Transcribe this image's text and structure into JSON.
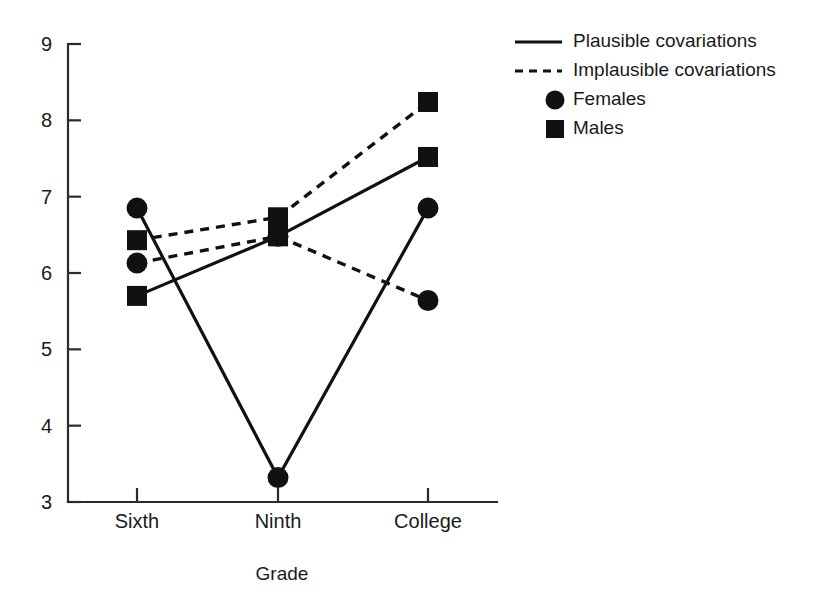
{
  "chart_data": {
    "type": "line",
    "title": "",
    "xlabel": "Grade",
    "ylabel": "",
    "categories": [
      "Sixth",
      "Ninth",
      "College"
    ],
    "ylim": [
      3,
      9
    ],
    "yticks": [
      3,
      4,
      5,
      6,
      7,
      8,
      9
    ],
    "grid": false,
    "legend_position": "top-right",
    "series": [
      {
        "name": "Plausible covariations – Females",
        "line_style": "solid",
        "marker": "circle",
        "values": [
          6.85,
          3.32,
          6.85
        ]
      },
      {
        "name": "Plausible covariations – Males",
        "line_style": "solid",
        "marker": "square",
        "values": [
          5.7,
          6.48,
          7.52
        ]
      },
      {
        "name": "Implausible covariations – Females",
        "line_style": "dashed",
        "marker": "circle",
        "values": [
          6.13,
          6.48,
          5.64
        ]
      },
      {
        "name": "Implausible covariations – Males",
        "line_style": "dashed",
        "marker": "square",
        "values": [
          6.43,
          6.73,
          8.24
        ]
      }
    ],
    "legend": [
      {
        "label": "Plausible covariations",
        "key": "solid-line"
      },
      {
        "label": "Implausible covariations",
        "key": "dashed-line"
      },
      {
        "label": "Females",
        "key": "circle-marker"
      },
      {
        "label": "Males",
        "key": "square-marker"
      }
    ]
  },
  "axis": {
    "y_labels": [
      "9",
      "8",
      "7",
      "6",
      "5",
      "4",
      "3"
    ],
    "x_labels": [
      "Sixth",
      "Ninth",
      "College"
    ],
    "x_title": "Grade"
  },
  "legend": {
    "items": [
      "Plausible covariations",
      "Implausible covariations",
      "Females",
      "Males"
    ]
  },
  "colors": {
    "ink": "#111111",
    "axis": "#2b2b2b",
    "background": "#ffffff"
  }
}
